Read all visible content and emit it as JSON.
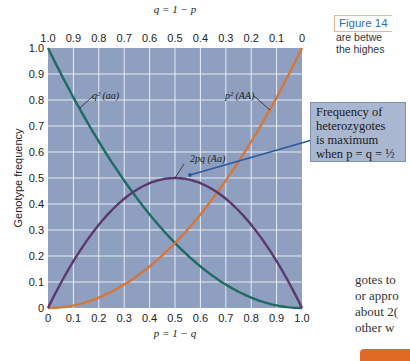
{
  "figure": {
    "label": "Figure 14",
    "side_line1": "are betwe",
    "side_line2": "the highes"
  },
  "callout": {
    "line1": "Frequency of",
    "line2": "heterozygotes",
    "line3": "is maximum",
    "line4": "when p = q = ½"
  },
  "body_text": [
    "gotes to",
    "or appro",
    "about 2(",
    "other w"
  ],
  "colors": {
    "plot_bg": "#8e9fbf",
    "grid": "#e8ecf4",
    "aa_curve": "#1e6b62",
    "AA_curve": "#d5773a",
    "Aa_curve": "#5b3a6b",
    "callout_line": "#2a5aa0",
    "callout_bg": "#a9b7d1"
  },
  "chart_data": {
    "type": "line",
    "title": "",
    "xlabel": "p = 1 − q",
    "x2label": "q = 1 − p",
    "ylabel": "Genotype frequency",
    "xlim": [
      0,
      1
    ],
    "ylim": [
      0,
      1
    ],
    "grid": true,
    "x_ticks": [
      "0",
      "0.1",
      "0.2",
      "0.3",
      "0.4",
      "0.5",
      "0.6",
      "0.7",
      "0.8",
      "0.9",
      "1.0"
    ],
    "x2_ticks": [
      "1.0",
      "0.9",
      "0.8",
      "0.7",
      "0.6",
      "0.5",
      "0.4",
      "0.3",
      "0.2",
      "0.1",
      "0"
    ],
    "y_ticks": [
      "0",
      "0.1",
      "0.2",
      "0.3",
      "0.4",
      "0.5",
      "0.6",
      "0.7",
      "0.8",
      "0.9",
      "1.0"
    ],
    "x": [
      0,
      0.1,
      0.2,
      0.3,
      0.4,
      0.5,
      0.6,
      0.7,
      0.8,
      0.9,
      1.0
    ],
    "series": [
      {
        "name": "q² (aa)",
        "values": [
          1.0,
          0.81,
          0.64,
          0.49,
          0.36,
          0.25,
          0.16,
          0.09,
          0.04,
          0.01,
          0
        ]
      },
      {
        "name": "p² (AA)",
        "values": [
          0,
          0.01,
          0.04,
          0.09,
          0.16,
          0.25,
          0.36,
          0.49,
          0.64,
          0.81,
          1.0
        ]
      },
      {
        "name": "2pq (Aa)",
        "values": [
          0,
          0.18,
          0.32,
          0.42,
          0.48,
          0.5,
          0.48,
          0.42,
          0.32,
          0.18,
          0
        ]
      }
    ],
    "annotations": [
      "Frequency of heterozygotes is maximum when p = q = ½"
    ]
  }
}
